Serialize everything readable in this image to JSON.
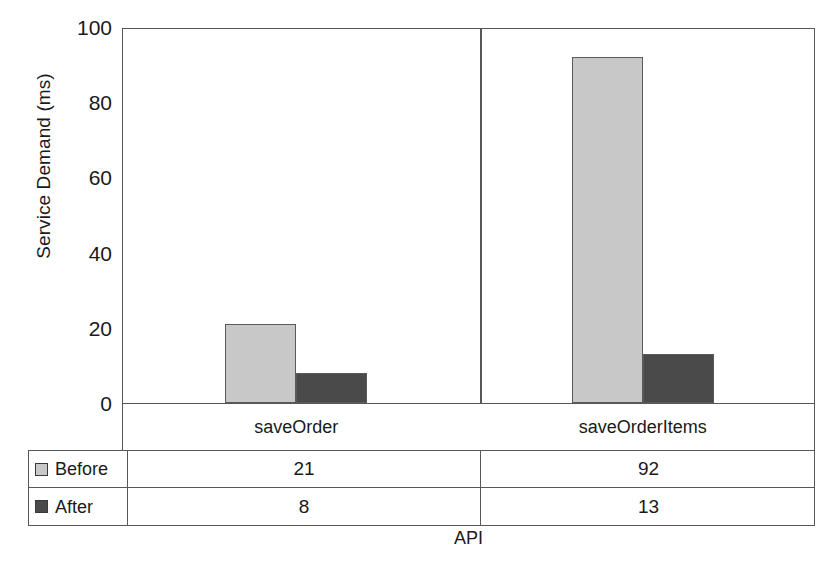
{
  "chart_data": {
    "type": "bar",
    "title": "",
    "subtitle": "",
    "xlabel": "API",
    "ylabel": "Service Demand (ms)",
    "categories": [
      "saveOrder",
      "saveOrderItems"
    ],
    "series": [
      {
        "name": "Before",
        "values": [
          21,
          92
        ],
        "color": "#c8c8c8"
      },
      {
        "name": "After",
        "values": [
          8,
          13
        ],
        "color": "#4a4a4a"
      }
    ],
    "ylim": [
      0,
      100
    ],
    "yticks": [
      0,
      20,
      40,
      60,
      80,
      100
    ],
    "ytick_labels": [
      "0",
      "20",
      "40",
      "60",
      "80",
      "100"
    ],
    "grid": false,
    "legend_position": "data-table-below",
    "data_table": {
      "row_header_labels": [
        "Before",
        "After"
      ],
      "column_headers": [
        "saveOrder",
        "saveOrderItems"
      ],
      "rows": [
        {
          "label": "Before",
          "swatch_color": "#c8c8c8",
          "cells": [
            "21",
            "92"
          ]
        },
        {
          "label": "After",
          "swatch_color": "#4a4a4a",
          "cells": [
            "8",
            "13"
          ]
        }
      ]
    }
  },
  "axis": {
    "y_title": "Service Demand (ms)",
    "x_title": "API",
    "y_tick_labels": [
      "100",
      "80",
      "60",
      "40",
      "20",
      "0"
    ]
  },
  "colors": {
    "before": "#c8c8c8",
    "after": "#4a4a4a",
    "axis_line": "#575757",
    "text": "#1a1a1a",
    "background": "#ffffff"
  }
}
